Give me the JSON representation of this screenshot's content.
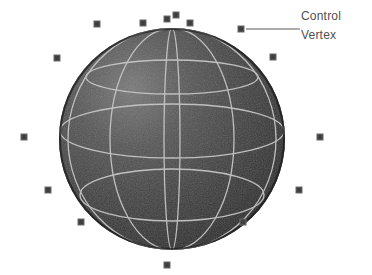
{
  "scene": {
    "title": "NURBS sphere with control vertices",
    "background_color": "#ffffff"
  },
  "annotation": {
    "label_line1": "Control",
    "label_line2": "Vertex",
    "text_color": "#4f4f4f",
    "leader_line": {
      "x1": 246,
      "y1": 29,
      "x2": 300,
      "y2": 29,
      "color": "#5a5a5a",
      "width": 1
    },
    "pointer_marker": {
      "x": 241,
      "y": 29
    }
  },
  "sphere": {
    "name": "nurbs-sphere",
    "center_x": 172,
    "center_y": 139,
    "radius_x": 113,
    "radius_y": 111,
    "fill_dark": "#2b2b2b",
    "fill_mid": "#474747",
    "fill_light": "#6d6d6d",
    "wireframe_color": "#c9c9c9",
    "wireframe_width": 1.3,
    "latitudes": [
      {
        "name": "lat-upper",
        "cy_offset": -62,
        "ry": 17
      },
      {
        "name": "lat-equator-upper",
        "cy_offset": -8,
        "ry": 27
      },
      {
        "name": "lat-lower",
        "cy_offset": 56,
        "ry": 26
      }
    ],
    "longitudes": [
      {
        "name": "lon-left-outer",
        "rx": 104
      },
      {
        "name": "lon-left-inner",
        "rx": 62
      },
      {
        "name": "lon-center",
        "rx": 8
      },
      {
        "name": "lon-right-inner",
        "rx": 58
      },
      {
        "name": "lon-right-outer",
        "rx": 100
      }
    ]
  },
  "control_vertices": {
    "marker_size": 6,
    "marker_color": "#3f3f3f",
    "marker_border_color": "#6a6a6a",
    "count": 15,
    "points": [
      {
        "name": "cv-top-left-far",
        "x": 97,
        "y": 24
      },
      {
        "name": "cv-top-left",
        "x": 143,
        "y": 23
      },
      {
        "name": "cv-top-center",
        "x": 167,
        "y": 19
      },
      {
        "name": "cv-top-apex",
        "x": 176,
        "y": 15
      },
      {
        "name": "cv-top-right",
        "x": 190,
        "y": 23
      },
      {
        "name": "cv-upper-left",
        "x": 57,
        "y": 58
      },
      {
        "name": "cv-upper-right",
        "x": 273,
        "y": 57
      },
      {
        "name": "cv-mid-left",
        "x": 24,
        "y": 137
      },
      {
        "name": "cv-mid-right",
        "x": 320,
        "y": 137
      },
      {
        "name": "cv-lower-left",
        "x": 48,
        "y": 190
      },
      {
        "name": "cv-lower-right",
        "x": 299,
        "y": 190
      },
      {
        "name": "cv-bottom-left",
        "x": 81,
        "y": 222
      },
      {
        "name": "cv-bottom-right",
        "x": 243,
        "y": 222
      },
      {
        "name": "cv-bottom-center",
        "x": 167,
        "y": 265
      },
      {
        "name": "cv-annotated",
        "x": 241,
        "y": 29
      }
    ]
  }
}
